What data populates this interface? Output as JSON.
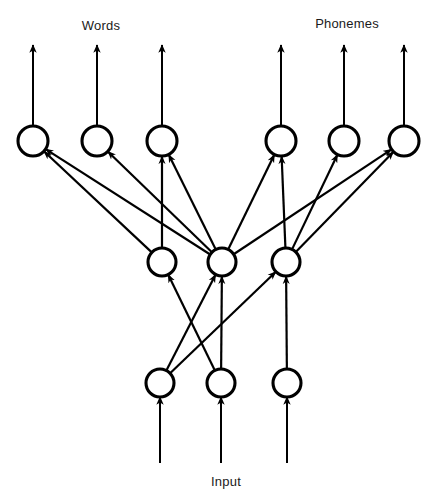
{
  "figure": {
    "type": "diagram",
    "subtype": "neural-network-architecture",
    "ink_color": "#000000",
    "background_color": "#ffffff",
    "canvas": {
      "width": 435,
      "height": 499
    }
  },
  "labels": {
    "words": {
      "text": "Words",
      "x": 101,
      "y": 25
    },
    "phonemes": {
      "text": "Phonemes",
      "x": 347,
      "y": 23
    },
    "input": {
      "text": "Input",
      "x": 226,
      "y": 481
    }
  },
  "layers": {
    "output": {
      "name": "output-layer",
      "y": 141,
      "radius": 15,
      "nodes": [
        {
          "id": "o1",
          "x": 33,
          "group": "words"
        },
        {
          "id": "o2",
          "x": 97,
          "group": "words"
        },
        {
          "id": "o3",
          "x": 162,
          "group": "words"
        },
        {
          "id": "o4",
          "x": 281,
          "group": "phonemes"
        },
        {
          "id": "o5",
          "x": 344,
          "group": "phonemes"
        },
        {
          "id": "o6",
          "x": 404,
          "group": "phonemes"
        }
      ]
    },
    "hidden": {
      "name": "hidden-layer",
      "y": 262,
      "radius": 14,
      "nodes": [
        {
          "id": "h1",
          "x": 162
        },
        {
          "id": "h2",
          "x": 222
        },
        {
          "id": "h3",
          "x": 286
        }
      ]
    },
    "input": {
      "name": "input-layer",
      "y": 383,
      "radius": 14,
      "nodes": [
        {
          "id": "i1",
          "x": 160
        },
        {
          "id": "i2",
          "x": 221
        },
        {
          "id": "i3",
          "x": 287
        }
      ]
    }
  },
  "output_arrows": [
    {
      "from": "o1",
      "x": 33,
      "y_top": 45
    },
    {
      "from": "o2",
      "x": 97,
      "y_top": 45
    },
    {
      "from": "o3",
      "x": 162,
      "y_top": 45
    },
    {
      "from": "o4",
      "x": 281,
      "y_top": 45
    },
    {
      "from": "o5",
      "x": 344,
      "y_top": 45
    },
    {
      "from": "o6",
      "x": 404,
      "y_top": 45
    }
  ],
  "input_arrows": [
    {
      "to": "i1",
      "x": 160,
      "y_bottom": 463
    },
    {
      "to": "i2",
      "x": 221,
      "y_bottom": 463
    },
    {
      "to": "i3",
      "x": 287,
      "y_bottom": 463
    }
  ],
  "edges_hidden_to_output": [
    {
      "from": "h1",
      "to": "o1"
    },
    {
      "from": "h2",
      "to": "o1"
    },
    {
      "from": "h2",
      "to": "o2"
    },
    {
      "from": "h1",
      "to": "o3"
    },
    {
      "from": "h2",
      "to": "o3"
    },
    {
      "from": "h2",
      "to": "o4"
    },
    {
      "from": "h3",
      "to": "o4"
    },
    {
      "from": "h3",
      "to": "o5"
    },
    {
      "from": "h2",
      "to": "o6"
    },
    {
      "from": "h3",
      "to": "o6"
    }
  ],
  "edges_input_to_hidden": [
    {
      "from": "i2",
      "to": "h1"
    },
    {
      "from": "i1",
      "to": "h2"
    },
    {
      "from": "i2",
      "to": "h2"
    },
    {
      "from": "i1",
      "to": "h3"
    },
    {
      "from": "i3",
      "to": "h3"
    }
  ],
  "counts": {
    "output_nodes": 6,
    "hidden_nodes": 3,
    "input_nodes": 3,
    "hidden_to_output_edges": 10,
    "input_to_hidden_edges": 5
  }
}
